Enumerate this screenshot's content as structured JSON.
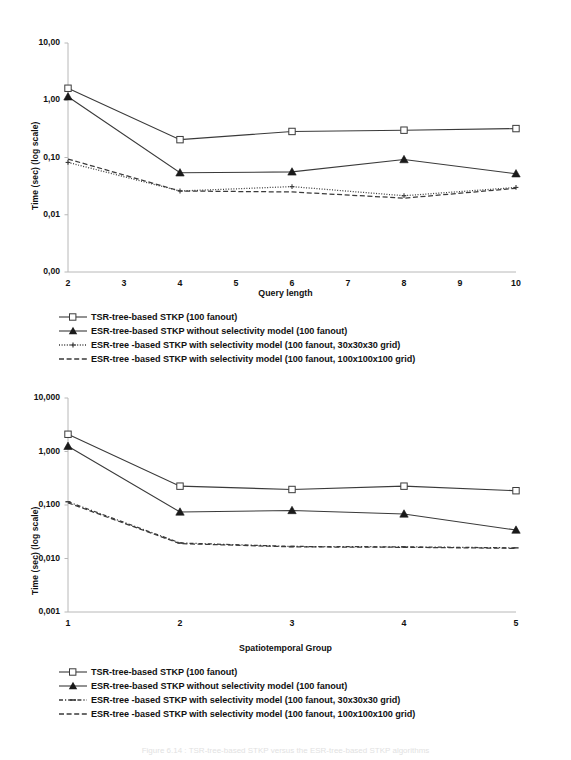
{
  "document": {
    "caption_partial": "Figure 6.14 : TSR-tree-based STKP versus the ESR-tree-based STKP algorithms"
  },
  "legend_series_styles": [
    "solid-open-square",
    "solid-filled-triangle",
    "dotted-small-marker",
    "dashed"
  ],
  "colors": {
    "line": "#3a3a3a",
    "axis": "#b8b8b8",
    "text": "#111111",
    "background": "#ffffff"
  },
  "chart_data": [
    {
      "id": "query-length-chart",
      "type": "line",
      "title": "",
      "xlabel": "Query length",
      "ylabel": "Time (sec) (log scale)",
      "x": [
        2,
        4,
        6,
        8,
        10
      ],
      "xticks": [
        "2",
        "3",
        "4",
        "5",
        "6",
        "7",
        "8",
        "9",
        "10"
      ],
      "xlim": [
        2,
        10
      ],
      "yticks": [
        "10,00",
        "1,00",
        "0,10",
        "0,01",
        "0,00"
      ],
      "ytickvalues": [
        10,
        1,
        0.1,
        0.01,
        0.001
      ],
      "ylim": [
        0.001,
        10
      ],
      "yscale": "log",
      "grid": false,
      "legend_position": "below",
      "series": [
        {
          "name": "TSR-tree-based STKP (100 fanout)",
          "marker": "open-square",
          "linestyle": "solid",
          "values": [
            1.62,
            0.205,
            0.285,
            0.3,
            0.32
          ]
        },
        {
          "name": "ESR-tree-based STKP without selectivity model  (100 fanout)",
          "marker": "filled-triangle",
          "linestyle": "solid",
          "values": [
            1.15,
            0.054,
            0.056,
            0.092,
            0.052
          ]
        },
        {
          "name": "ESR-tree -based STKP with selectivity model  (100 fanout, 30x30x30 grid)",
          "marker": "small-cross",
          "linestyle": "dotted",
          "values": [
            0.082,
            0.026,
            0.031,
            0.0215,
            0.03
          ]
        },
        {
          "name": "ESR-tree -based STKP with selectivity model  (100 fanout, 100x100x100 grid)",
          "marker": "none",
          "linestyle": "dashed",
          "values": [
            0.094,
            0.026,
            0.025,
            0.0195,
            0.029
          ]
        }
      ]
    },
    {
      "id": "spatiotemporal-group-chart",
      "type": "line",
      "title": "",
      "xlabel": "Spatiotemporal Group",
      "ylabel": "Time (sec) (log scale)",
      "x": [
        1,
        2,
        3,
        4,
        5
      ],
      "xticks": [
        "1",
        "2",
        "3",
        "4",
        "5"
      ],
      "xlim": [
        1,
        5
      ],
      "yticks": [
        "10,000",
        "1,000",
        "0,100",
        "0,010",
        "0,001"
      ],
      "ytickvalues": [
        10,
        1,
        0.1,
        0.01,
        0.001
      ],
      "ylim": [
        0.001,
        10
      ],
      "yscale": "log",
      "grid": false,
      "legend_position": "below",
      "series": [
        {
          "name": "TSR-tree-based STKP (100 fanout)",
          "marker": "open-square",
          "linestyle": "solid",
          "values": [
            2.1,
            0.225,
            0.195,
            0.225,
            0.185
          ]
        },
        {
          "name": "ESR-tree-based STKP without selectivity model  (100 fanout)",
          "marker": "filled-triangle",
          "linestyle": "solid",
          "values": [
            1.25,
            0.074,
            0.079,
            0.068,
            0.034
          ]
        },
        {
          "name": "ESR-tree -based STKP with selectivity model  (100 fanout, 30x30x30 grid)",
          "marker": "small-dash",
          "linestyle": "dashdot",
          "values": [
            0.115,
            0.0195,
            0.0168,
            0.0165,
            0.0158
          ]
        },
        {
          "name": "ESR-tree -based STKP with selectivity model  (100 fanout, 100x100x100 grid)",
          "marker": "none",
          "linestyle": "dashed",
          "values": [
            0.11,
            0.019,
            0.0165,
            0.0162,
            0.0155
          ]
        }
      ]
    }
  ]
}
